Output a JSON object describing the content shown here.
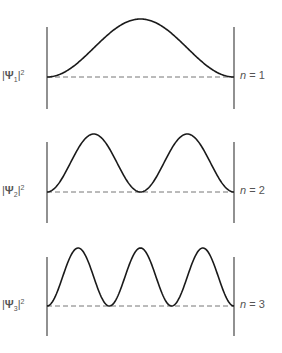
{
  "colors": {
    "curve": "#1a1a1a",
    "axis": "#555555",
    "baseline": "#777777",
    "text": "#555555"
  },
  "panels": [
    {
      "n": 1,
      "left_label": {
        "bar_open": "|",
        "symbol": "Ψ",
        "subscript": "1",
        "bar_close": "|",
        "superscript": "2"
      },
      "right_label": {
        "var": "n",
        "eq": " = 1"
      },
      "baseline_y": 77,
      "peak_y": 19,
      "axis_top": 27,
      "axis_bottom": 109
    },
    {
      "n": 2,
      "left_label": {
        "bar_open": "|",
        "symbol": "Ψ",
        "subscript": "2",
        "bar_close": "|",
        "superscript": "2"
      },
      "right_label": {
        "var": "n",
        "eq": " = 2"
      },
      "baseline_y": 192,
      "peak_y": 134,
      "axis_top": 142,
      "axis_bottom": 223
    },
    {
      "n": 3,
      "left_label": {
        "bar_open": "|",
        "symbol": "Ψ",
        "subscript": "3",
        "bar_close": "|",
        "superscript": "2"
      },
      "right_label": {
        "var": "n",
        "eq": " = 3"
      },
      "baseline_y": 306,
      "peak_y": 248,
      "axis_top": 257,
      "axis_bottom": 336
    }
  ],
  "box": {
    "left_x": 47,
    "right_x": 234
  }
}
